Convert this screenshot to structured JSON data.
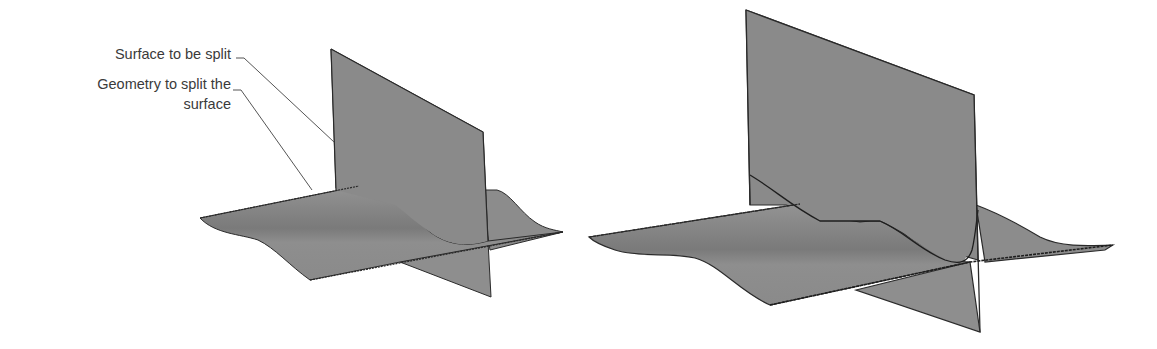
{
  "figure": {
    "callouts": [
      {
        "id": "surface",
        "text": "Surface to be split"
      },
      {
        "id": "geometry",
        "line1": "Geometry to split the",
        "line2": "surface"
      }
    ],
    "colors": {
      "surface_fill": "#8c8c8c",
      "surface_fill_dark": "#7c7c7c",
      "surface_fill_light": "#969696",
      "edge": "#2a2a2a",
      "leader_line": "#555555",
      "text": "#3a3a3a",
      "background": "#ffffff"
    },
    "panels": [
      {
        "id": "before",
        "description": "Wavy surface intersected by vertical plane"
      },
      {
        "id": "after",
        "description": "Surface split along the intersection curve"
      }
    ]
  }
}
